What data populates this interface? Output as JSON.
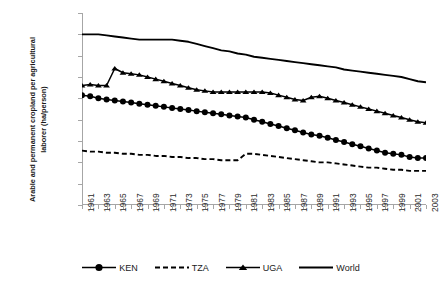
{
  "chart_data": {
    "type": "line",
    "title": "",
    "xlabel": "",
    "ylabel": "Arable and permanent cropland per agricultural laborer (ha/person)",
    "xlim": [
      1961,
      2003
    ],
    "ylim": [
      0,
      1.8
    ],
    "grid": false,
    "legend_position": "bottom",
    "ytick_labels": [
      "1.80",
      "1.60",
      "1.40",
      "1.20",
      "1.00",
      "0.80",
      "0.60",
      "0.40",
      "0.20",
      "-"
    ],
    "ytick_values": [
      1.8,
      1.6,
      1.4,
      1.2,
      1.0,
      0.8,
      0.6,
      0.4,
      0.2,
      0.0
    ],
    "x": [
      1961,
      1962,
      1963,
      1964,
      1965,
      1966,
      1967,
      1968,
      1969,
      1970,
      1971,
      1972,
      1973,
      1974,
      1975,
      1976,
      1977,
      1978,
      1979,
      1980,
      1981,
      1982,
      1983,
      1984,
      1985,
      1986,
      1987,
      1988,
      1989,
      1990,
      1991,
      1992,
      1993,
      1994,
      1995,
      1996,
      1997,
      1998,
      1999,
      2000,
      2001,
      2002,
      2003
    ],
    "xtick_labels": [
      "1961",
      "1963",
      "1965",
      "1967",
      "1969",
      "1971",
      "1973",
      "1975",
      "1977",
      "1979",
      "1981",
      "1983",
      "1985",
      "1987",
      "1989",
      "1991",
      "1993",
      "1995",
      "1997",
      "1999",
      "2001",
      "2003"
    ],
    "series": [
      {
        "name": "KEN",
        "marker": "circle",
        "dash": false,
        "color": "#000000",
        "values": [
          1.03,
          1.02,
          1.0,
          0.99,
          0.98,
          0.97,
          0.96,
          0.95,
          0.94,
          0.93,
          0.92,
          0.91,
          0.9,
          0.89,
          0.88,
          0.87,
          0.86,
          0.85,
          0.84,
          0.83,
          0.82,
          0.8,
          0.78,
          0.76,
          0.74,
          0.72,
          0.7,
          0.68,
          0.66,
          0.65,
          0.63,
          0.61,
          0.59,
          0.57,
          0.55,
          0.53,
          0.51,
          0.49,
          0.48,
          0.47,
          0.45,
          0.44,
          0.44
        ]
      },
      {
        "name": "TZA",
        "marker": "none",
        "dash": true,
        "color": "#000000",
        "values": [
          0.51,
          0.5,
          0.5,
          0.49,
          0.49,
          0.48,
          0.48,
          0.47,
          0.47,
          0.46,
          0.46,
          0.45,
          0.45,
          0.44,
          0.44,
          0.43,
          0.43,
          0.42,
          0.42,
          0.42,
          0.48,
          0.48,
          0.47,
          0.46,
          0.45,
          0.44,
          0.43,
          0.42,
          0.41,
          0.4,
          0.4,
          0.39,
          0.38,
          0.37,
          0.36,
          0.35,
          0.35,
          0.34,
          0.33,
          0.33,
          0.32,
          0.32,
          0.32
        ]
      },
      {
        "name": "UGA",
        "marker": "triangle",
        "dash": false,
        "color": "#000000",
        "values": [
          1.12,
          1.13,
          1.12,
          1.12,
          1.28,
          1.24,
          1.23,
          1.22,
          1.2,
          1.18,
          1.16,
          1.14,
          1.12,
          1.1,
          1.08,
          1.07,
          1.06,
          1.06,
          1.06,
          1.06,
          1.06,
          1.06,
          1.06,
          1.05,
          1.03,
          1.01,
          0.99,
          0.98,
          1.01,
          1.02,
          1.0,
          0.98,
          0.96,
          0.94,
          0.92,
          0.9,
          0.88,
          0.86,
          0.84,
          0.82,
          0.8,
          0.78,
          0.77
        ]
      },
      {
        "name": "World",
        "marker": "none",
        "dash": false,
        "color": "#000000",
        "values": [
          1.6,
          1.6,
          1.6,
          1.59,
          1.58,
          1.57,
          1.56,
          1.55,
          1.55,
          1.55,
          1.55,
          1.55,
          1.54,
          1.53,
          1.51,
          1.49,
          1.47,
          1.45,
          1.44,
          1.42,
          1.41,
          1.39,
          1.38,
          1.37,
          1.36,
          1.35,
          1.34,
          1.33,
          1.32,
          1.31,
          1.3,
          1.29,
          1.27,
          1.26,
          1.25,
          1.24,
          1.23,
          1.22,
          1.21,
          1.2,
          1.18,
          1.16,
          1.15
        ]
      }
    ],
    "legend": [
      {
        "label": "KEN",
        "marker": "circle",
        "dash": false
      },
      {
        "label": "TZA",
        "marker": "none",
        "dash": true
      },
      {
        "label": "UGA",
        "marker": "triangle",
        "dash": false
      },
      {
        "label": "World",
        "marker": "none",
        "dash": false
      }
    ]
  }
}
